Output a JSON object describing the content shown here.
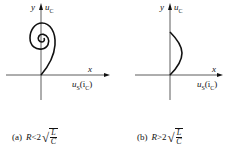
{
  "figures": [
    {
      "id": "a",
      "axes": {
        "y_label_var": "y",
        "y_label_quantity": "u",
        "y_label_sub": "C",
        "x_label_var": "x",
        "x_label_quantity": "u",
        "x_label_sub": "S",
        "x_label_alt": "(i",
        "x_label_alt_sub": "C",
        "x_label_alt_close": ")"
      },
      "curve": "spiral converging inward",
      "caption": {
        "tag": "(a)",
        "lhs": "R",
        "relation": "<",
        "coef": "2",
        "num": "L",
        "den": "C"
      }
    },
    {
      "id": "b",
      "axes": {
        "y_label_var": "y",
        "y_label_quantity": "u",
        "y_label_sub": "C",
        "x_label_var": "x",
        "x_label_quantity": "u",
        "x_label_sub": "S",
        "x_label_alt": "(i",
        "x_label_alt_sub": "C",
        "x_label_alt_close": ")"
      },
      "curve": "single arc bulging right",
      "caption": {
        "tag": "(b)",
        "lhs": "R",
        "relation": ">",
        "coef": "2",
        "num": "L",
        "den": "C"
      }
    }
  ],
  "colors": {
    "stroke": "#111111",
    "background": "#ffffff"
  }
}
